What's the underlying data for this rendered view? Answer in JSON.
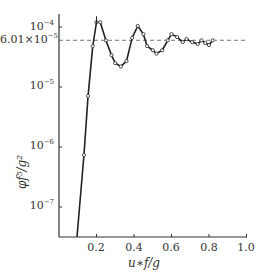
{
  "chart_data": {
    "type": "line",
    "title": "",
    "xlabel": "u*f/g",
    "ylabel": "φf^5/g^2",
    "xscale": "linear",
    "yscale": "log",
    "xlim": [
      0,
      1.0
    ],
    "ylim": [
      3e-08,
      0.00013
    ],
    "grid": false,
    "legend": null,
    "x_ticks": [
      "0.2",
      "0.4",
      "0.6",
      "0.8",
      "1.0"
    ],
    "y_ticks": [
      "10^-4",
      "6.01×10^-5",
      "10^-5",
      "10^-6",
      "10^-7"
    ],
    "reference_line": {
      "type": "horizontal",
      "style": "dashed",
      "value": 6.01e-05,
      "label": "6.01×10^-5"
    },
    "series": [
      {
        "name": "spectrum",
        "marker": "circle",
        "x": [
          0.1,
          0.133,
          0.155,
          0.18,
          0.2,
          0.22,
          0.25,
          0.28,
          0.3,
          0.33,
          0.36,
          0.39,
          0.42,
          0.45,
          0.47,
          0.5,
          0.52,
          0.55,
          0.58,
          0.6,
          0.63,
          0.66,
          0.68,
          0.71,
          0.74,
          0.76,
          0.78,
          0.8,
          0.82
        ],
        "y": [
          3e-08,
          7.3e-07,
          7.1e-06,
          4.8e-05,
          0.00012,
          0.00012,
          6e-05,
          3.4e-05,
          2.5e-05,
          2.2e-05,
          2.7e-05,
          6.6e-05,
          0.000104,
          7.6e-05,
          4.8e-05,
          4.1e-05,
          3.6e-05,
          4.1e-05,
          6e-05,
          7.6e-05,
          6.8e-05,
          5.6e-05,
          6.3e-05,
          5.6e-05,
          5.2e-05,
          6e-05,
          5.4e-05,
          5e-05,
          6e-05
        ]
      }
    ]
  },
  "labels": {
    "y_ticks": [
      {
        "base": "10",
        "exp": "−4"
      },
      {
        "base": "6.01×10",
        "exp": "−5"
      },
      {
        "base": "10",
        "exp": "−5"
      },
      {
        "base": "10",
        "exp": "−6"
      },
      {
        "base": "10",
        "exp": "−7"
      }
    ],
    "x_ticks": [
      "0.2",
      "0.4",
      "0.6",
      "0.8",
      "1.0"
    ],
    "xtitle": "u∗f/g",
    "ytitle": "φf⁵/g²"
  }
}
